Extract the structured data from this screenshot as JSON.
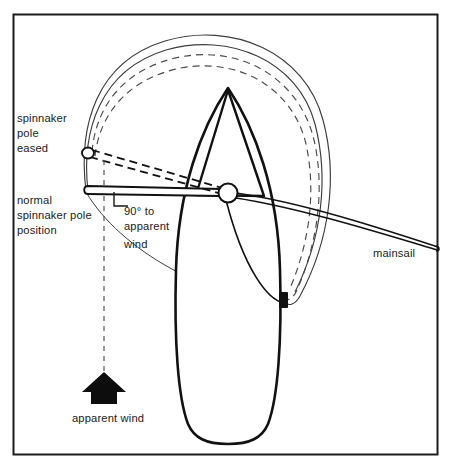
{
  "figure": {
    "width": 451,
    "height": 470,
    "background": "#ffffff",
    "border_color": "#1c1c1c"
  },
  "colors": {
    "ink": "#1a1a1a",
    "hull_stroke": "#111111",
    "sail_stroke": "#111111",
    "spinnaker_stroke": "#3c3c3c",
    "dashed_stroke": "#4a4a4a",
    "fitting_fill": "#101010",
    "arrow_fill": "#0d0d0d",
    "paper": "#ffffff"
  },
  "labels": {
    "spinnaker_pole_eased": {
      "lines": [
        "spinnaker",
        "pole",
        "eased"
      ],
      "line1": "spinnaker",
      "line2": "pole",
      "line3": "eased"
    },
    "normal_spinnaker_pole_position": {
      "lines": [
        "normal",
        "spinnaker pole",
        "position"
      ],
      "line1": "normal",
      "line2": "spinnaker pole",
      "line3": "position"
    },
    "ninety_to_apparent_wind": {
      "lines": [
        "90° to",
        "apparent",
        "wind"
      ],
      "line1": "90° to",
      "line2": "apparent",
      "line3": "wind"
    },
    "mainsail": "mainsail",
    "apparent_wind": "apparent wind"
  },
  "annotations": {
    "angle_marker": "right-angle 90 degrees",
    "wind_direction": "upward",
    "pole_states": [
      "normal",
      "eased"
    ]
  },
  "geometry": {
    "frame": {
      "x": 13,
      "y": 14,
      "w": 425,
      "h": 441
    },
    "mast": {
      "cx": 228,
      "cy": 193,
      "r": 9.5
    },
    "pole_normal": {
      "x1": 86,
      "y1": 190,
      "x2": 222,
      "y2": 193
    },
    "pole_eased": {
      "x1": 88,
      "y1": 150,
      "x2": 222,
      "y2": 192
    },
    "wind_arrow": {
      "cx": 104,
      "cy": 392
    }
  }
}
